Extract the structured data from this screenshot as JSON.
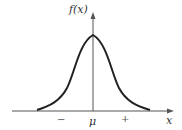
{
  "diagram": {
    "type": "normal-distribution-curve",
    "y_axis_label": "f(x)",
    "x_axis_label": "x",
    "tick_labels": {
      "minus": "−",
      "mean": "μ",
      "plus": "+"
    },
    "colors": {
      "curve": "#222222",
      "axes": "#555555"
    }
  }
}
